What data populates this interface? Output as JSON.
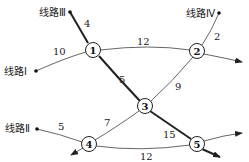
{
  "routes": {
    "I": "线路Ⅰ",
    "II": "线路Ⅱ",
    "III": "线路Ⅲ",
    "IV": "线路Ⅳ"
  },
  "nodes": [
    {
      "id": "1",
      "label": "1"
    },
    {
      "id": "2",
      "label": "2"
    },
    {
      "id": "3",
      "label": "3"
    },
    {
      "id": "4",
      "label": "4"
    },
    {
      "id": "5",
      "label": "5"
    }
  ],
  "edges": {
    "III_1": "4",
    "I_1": "10",
    "1_2": "12",
    "IV_2": "2",
    "1_3": "5",
    "2_3": "9",
    "II_4": "5",
    "4_3": "7",
    "3_5": "15",
    "4_5": "12"
  }
}
